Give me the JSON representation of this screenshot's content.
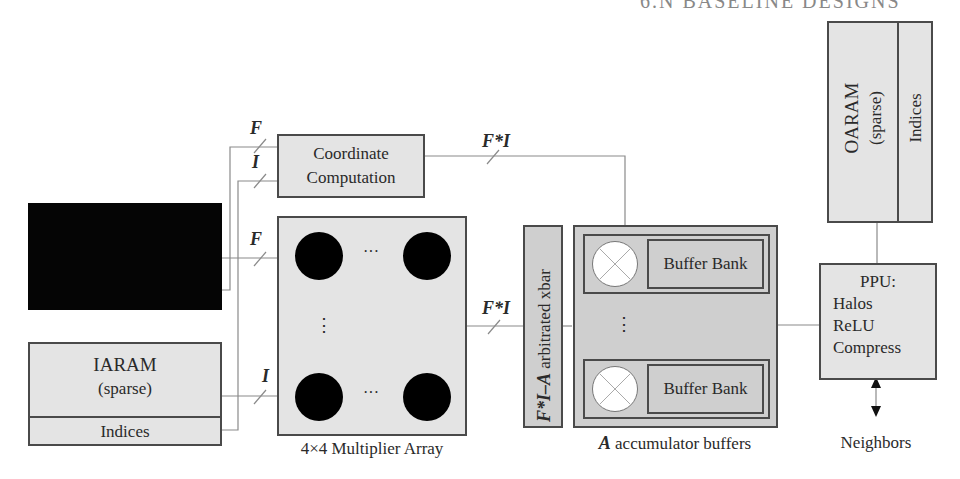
{
  "header": {
    "text": "6.N BASELINE DESIGNS"
  },
  "blocks": {
    "black_block": {
      "label": ""
    },
    "iaram": {
      "title": "IARAM",
      "subtitle": "(sparse)",
      "indices": "Indices"
    },
    "coordinate": {
      "line1": "Coordinate",
      "line2": "Computation"
    },
    "multiplier": {
      "caption": "4×4 Multiplier Array",
      "h_ellipsis": "···",
      "v_ellipsis": "⋮"
    },
    "xbar": {
      "var": "F*I–A",
      "label": " arbitrated xbar"
    },
    "accumulator": {
      "caption_var": "A",
      "caption": " accumulator buffers",
      "bank1": "Buffer Bank",
      "bank2": "Buffer Bank",
      "v_ellipsis": "⋮"
    },
    "oaram": {
      "title": "OARAM",
      "subtitle": "(sparse)",
      "indices": "Indices"
    },
    "ppu": {
      "title": "PPU:",
      "items": [
        "Halos",
        "ReLU",
        "Compress"
      ]
    },
    "neighbors": {
      "label": "Neighbors"
    }
  },
  "wire_labels": {
    "coord_F": "F",
    "coord_I": "I",
    "mult_F": "F",
    "mult_I": "I",
    "coord_out": "F*I",
    "mult_out": "F*I"
  },
  "colors": {
    "box_fill": "#e4e4e4",
    "box_dark_fill": "#cfcfcf",
    "border": "#4a4a4a",
    "wire": "#8a8a8a",
    "multiplier_dot": "#000000"
  }
}
